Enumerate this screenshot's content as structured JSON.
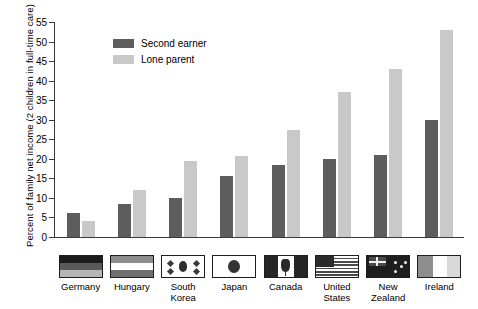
{
  "chart_data": {
    "type": "bar",
    "title": "",
    "xlabel": "",
    "ylabel": "Percent of family net income (2 children in full-time care)",
    "ylim": [
      0,
      55
    ],
    "ytick_step": 5,
    "yticks": [
      "0",
      "5",
      "10",
      "15",
      "20",
      "25",
      "30",
      "35",
      "40",
      "45",
      "50",
      "55"
    ],
    "grid": false,
    "legend_position": "top-left-inside",
    "categories": [
      "Germany",
      "Hungary",
      "South Korea",
      "Japan",
      "Canada",
      "United States",
      "New Zealand",
      "Ireland"
    ],
    "series": [
      {
        "name": "Second earner",
        "color": "#5d5d5d",
        "values": [
          6.2,
          8.5,
          10.0,
          15.5,
          18.5,
          20.0,
          21.0,
          30.0
        ]
      },
      {
        "name": "Lone parent",
        "color": "#c9c9c9",
        "values": [
          4.2,
          12.0,
          19.5,
          20.7,
          27.3,
          37.0,
          43.0,
          53.0
        ]
      }
    ]
  },
  "legend": {
    "items": [
      {
        "label": "Second earner",
        "swatch": "dark"
      },
      {
        "label": "Lone parent",
        "swatch": "light"
      }
    ]
  },
  "flags": {
    "Germany": "flag-germany",
    "Hungary": "flag-hungary",
    "South Korea": "flag-south-korea",
    "Japan": "flag-japan",
    "Canada": "flag-canada",
    "United States": "flag-united-states",
    "New Zealand": "flag-new-zealand",
    "Ireland": "flag-ireland"
  },
  "colors": {
    "second_earner": "#5d5d5d",
    "lone_parent": "#c9c9c9",
    "axis": "#3a3a3a",
    "background": "#ffffff"
  }
}
